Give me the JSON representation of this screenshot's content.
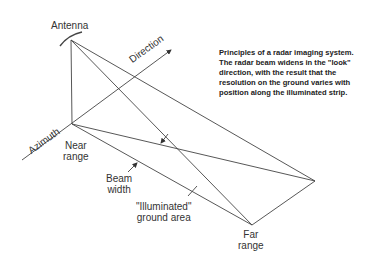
{
  "labels": {
    "antenna": "Antenna",
    "direction": "Direction",
    "azimuth": "Azimuth",
    "near_range": [
      "Near",
      "range"
    ],
    "beam_width": [
      "Beam",
      "width"
    ],
    "illuminated": [
      "\"Illuminated\"",
      "ground area"
    ],
    "far_range": [
      "Far",
      "range"
    ]
  },
  "caption": [
    "Principles of a radar imaging system.",
    "The radar beam widens in the \"look\"",
    "direction, with the result that the",
    "resolution on the ground varies with",
    "position along the illuminated strip."
  ],
  "colors": {
    "line": "#444444",
    "text": "#222222"
  }
}
